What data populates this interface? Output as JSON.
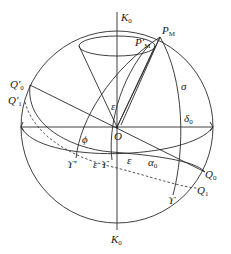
{
  "diagram": {
    "type": "celestial-sphere",
    "labels": {
      "k0_top": "K",
      "k0_top_sub": "0",
      "k0_bottom": "K",
      "k0_bottom_sub": "0",
      "pm": "P",
      "pm_sub": "M",
      "pm_prime": "P′",
      "pm_prime_sub": "M",
      "q0_prime": "Q′",
      "q0_prime_sub": "0",
      "q1_prime": "Q′",
      "q1_prime_sub": "1",
      "q0": "Q",
      "q0_sub": "0",
      "q1": "Q",
      "q1_sub": "1",
      "origin": "O",
      "sigma": "σ",
      "delta0": "δ",
      "delta0_sub": "0",
      "alpha0": "α",
      "alpha0_sub": "0",
      "epsilon_top": "ε",
      "epsilon_mid": "ε",
      "epsilon_left": "ε",
      "phi": "ϕ",
      "aries": "ϒ",
      "aries_prime": "ϒ′",
      "aries_lower": "ϒ"
    },
    "colors": {
      "stroke": "#2a2a2a",
      "text": "#1a1a1a",
      "background": "#ffffff"
    }
  }
}
